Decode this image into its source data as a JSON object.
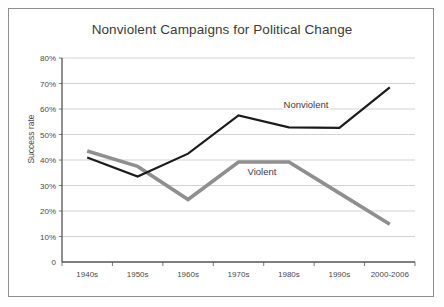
{
  "chart_data": {
    "type": "line",
    "title": "Nonviolent Campaigns for Political Change",
    "xlabel": "",
    "ylabel": "Success rate",
    "categories": [
      "1940s",
      "1950s",
      "1960s",
      "1970s",
      "1980s",
      "1990s",
      "2000-2006"
    ],
    "ytick_labels": [
      "0",
      "10%",
      "20%",
      "30%",
      "40%",
      "50%",
      "60%",
      "70%",
      "80%"
    ],
    "ytick_values": [
      0,
      10,
      20,
      30,
      40,
      50,
      60,
      70,
      80
    ],
    "ylim": [
      0,
      80
    ],
    "grid": "horizontal",
    "legend_position": "inline-annotation",
    "series": [
      {
        "name": "Nonviolent",
        "color": "#1b1b1b",
        "width": 2.2,
        "values": [
          41.0,
          33.5,
          42.5,
          57.5,
          52.8,
          52.6,
          68.5
        ],
        "label": "Nonviolent",
        "label_x": 306,
        "label_y": 108
      },
      {
        "name": "Violent",
        "color": "#8f8f8f",
        "width": 3.6,
        "values": [
          43.5,
          37.5,
          24.5,
          39.2,
          39.2,
          27.0,
          14.8
        ],
        "label": "Violent",
        "label_x": 262,
        "label_y": 175
      }
    ],
    "annotations": [
      {
        "text": "Nonviolent",
        "series": "Nonviolent"
      },
      {
        "text": "Violent",
        "series": "Violent"
      }
    ]
  },
  "colors": {
    "frame": "#8e8e8e",
    "grid": "#c8c8c8",
    "axis": "#555555",
    "title_text": "#3b3b3b",
    "tick_text": "#4a4a4a",
    "nonviolent": "#1b1b1b",
    "violent": "#8f8f8f",
    "background": "#ffffff"
  }
}
